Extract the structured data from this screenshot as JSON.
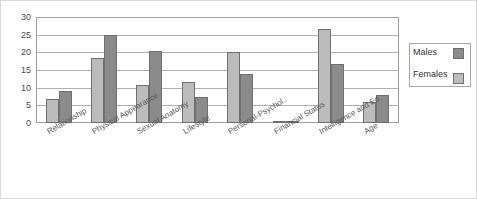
{
  "chart_data": {
    "type": "bar",
    "title": "",
    "xlabel": "",
    "ylabel": "",
    "ylim": [
      0,
      30
    ],
    "yticks": [
      0,
      5,
      10,
      15,
      20,
      25,
      30
    ],
    "grid": true,
    "legend_position": "right",
    "categories": [
      "Relationship",
      "Physical Appearance",
      "Sexual Anatomy",
      "Lifestyle",
      "Personal-Psychol..",
      "Financial Status",
      "Intelligence and Ed.",
      "Age"
    ],
    "series": [
      {
        "name": "Females",
        "color": "#bcbcbc",
        "values": [
          6.8,
          18.5,
          10.9,
          11.6,
          20.0,
          0.3,
          26.5,
          6.0
        ]
      },
      {
        "name": "Males",
        "color": "#8b8b8b",
        "values": [
          9.0,
          25.0,
          20.4,
          7.3,
          13.8,
          0.5,
          16.8,
          8.0
        ]
      }
    ]
  },
  "legend": {
    "items": [
      {
        "label": "Males",
        "swatch": "males"
      },
      {
        "label": "Females",
        "swatch": "females"
      }
    ]
  },
  "colors": {
    "females_bar": "#bcbcbc",
    "males_bar": "#8b8b8b",
    "bar_outline": "#6f6f6f",
    "gridline": "#b0b0b0",
    "plot_border": "#9e9e9e",
    "tick_text": "#4a4a4a",
    "label_text": "#5a5a5a"
  }
}
